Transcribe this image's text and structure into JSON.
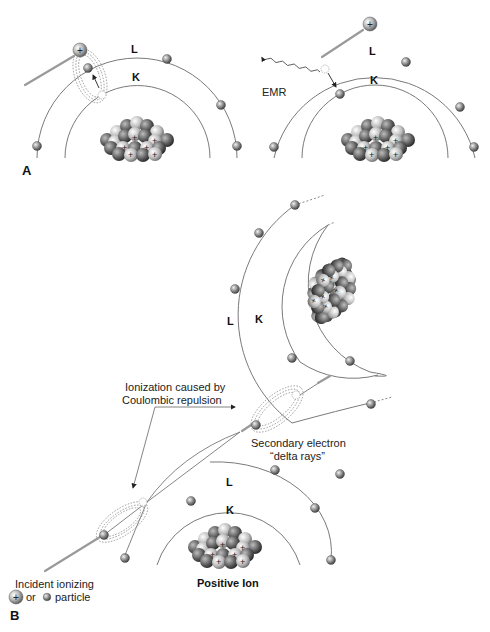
{
  "panels": {
    "a": {
      "label": "A",
      "left_atom": {
        "shell_outer": "L",
        "shell_inner": "K"
      },
      "right_atom": {
        "shell_outer": "L",
        "shell_inner": "K",
        "emission": "EMR"
      }
    },
    "b": {
      "label": "B",
      "upper_atom": {
        "shell_outer": "L",
        "shell_inner": "K"
      },
      "lower_atom": {
        "shell_outer": "L",
        "shell_inner": "K",
        "caption": "Positive Ion"
      },
      "annotation_ionization_line1": "Ionization caused by",
      "annotation_ionization_line2": "Coulombic repulsion",
      "annotation_secondary_line1": "Secondary electron",
      "annotation_secondary_line2": "“delta rays”",
      "legend_line1": "Incident ionizing",
      "legend_or": "or",
      "legend_particle": "particle"
    }
  },
  "colors": {
    "orbit": "#7a7a7a",
    "nucleus_light": "#d8d8d8",
    "nucleus_dark": "#3a3a3a",
    "text": "#111111"
  }
}
